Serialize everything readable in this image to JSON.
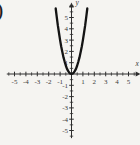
{
  "figure": {
    "answer_label_fragment": ")"
  },
  "chart_data": {
    "type": "line",
    "title": "",
    "xlabel": "x",
    "ylabel": "y",
    "xlim": [
      -5.5,
      5.5
    ],
    "ylim": [
      -5.5,
      5.8
    ],
    "grid": false,
    "tick_step_minor": 0.5,
    "x_tick_labels": [
      -5,
      -4,
      -3,
      -2,
      -1,
      1,
      2,
      3,
      4,
      5
    ],
    "y_tick_labels": [
      -5,
      -4,
      -3,
      -2,
      -1,
      1,
      2,
      3,
      4,
      5
    ],
    "legend": "none",
    "series": [
      {
        "name": "upward-parabola-vertex-at-origin",
        "approx_equation": "y = 3x^2",
        "points": [
          [
            -1.39,
            5.8
          ],
          [
            -1.3,
            5.07
          ],
          [
            -1.2,
            4.32
          ],
          [
            -1.1,
            3.63
          ],
          [
            -1.0,
            3.0
          ],
          [
            -0.9,
            2.43
          ],
          [
            -0.8,
            1.92
          ],
          [
            -0.7,
            1.47
          ],
          [
            -0.6,
            1.08
          ],
          [
            -0.5,
            0.75
          ],
          [
            -0.4,
            0.48
          ],
          [
            -0.3,
            0.27
          ],
          [
            -0.2,
            0.12
          ],
          [
            -0.1,
            0.03
          ],
          [
            0,
            0
          ],
          [
            0.1,
            0.03
          ],
          [
            0.2,
            0.12
          ],
          [
            0.3,
            0.27
          ],
          [
            0.4,
            0.48
          ],
          [
            0.5,
            0.75
          ],
          [
            0.6,
            1.08
          ],
          [
            0.7,
            1.47
          ],
          [
            0.8,
            1.92
          ],
          [
            0.9,
            2.43
          ],
          [
            1.0,
            3.0
          ],
          [
            1.1,
            3.63
          ],
          [
            1.2,
            4.32
          ],
          [
            1.3,
            5.07
          ],
          [
            1.39,
            5.8
          ]
        ]
      }
    ],
    "colors": {
      "curve": "#141414",
      "axis": "#2e2e2e",
      "text": "#3a3a3a",
      "background": "#f5f4f1"
    }
  }
}
